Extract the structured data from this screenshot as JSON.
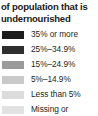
{
  "legend": {
    "title_lines": [
      "of population that is",
      "undernourished"
    ],
    "title_full": "of population that is undernourished",
    "entries": [
      {
        "label": "35% or more",
        "color": "#1c1c1c"
      },
      {
        "label": "25%–34.9%",
        "color": "#2f2f2f"
      },
      {
        "label": "15%–24.9%",
        "color": "#9b9b9b"
      },
      {
        "label": "5%–14.9%",
        "color": "#c9c9c9"
      },
      {
        "label": "Less than 5%",
        "color": "#dcdcdc"
      },
      {
        "label": "Missing or",
        "color": "#e2e2e2"
      }
    ]
  }
}
